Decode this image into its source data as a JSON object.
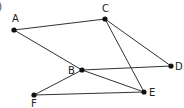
{
  "corner_mark": ")",
  "nodes": [
    {
      "id": "A",
      "label": "A",
      "x": 14,
      "y": 30,
      "lx": 12,
      "ly": 22
    },
    {
      "id": "C",
      "label": "C",
      "x": 105,
      "y": 19,
      "lx": 102,
      "ly": 12
    },
    {
      "id": "B",
      "label": "B",
      "x": 82,
      "y": 70,
      "lx": 68,
      "ly": 74
    },
    {
      "id": "D",
      "label": "D",
      "x": 171,
      "y": 66,
      "lx": 175,
      "ly": 70
    },
    {
      "id": "F",
      "label": "F",
      "x": 34,
      "y": 95,
      "lx": 31,
      "ly": 107
    },
    {
      "id": "E",
      "label": "E",
      "x": 144,
      "y": 92,
      "lx": 149,
      "ly": 96
    }
  ],
  "edges": [
    [
      "A",
      "C"
    ],
    [
      "A",
      "B"
    ],
    [
      "C",
      "D"
    ],
    [
      "C",
      "E"
    ],
    [
      "B",
      "D"
    ],
    [
      "B",
      "E"
    ],
    [
      "B",
      "F"
    ],
    [
      "F",
      "E"
    ]
  ]
}
